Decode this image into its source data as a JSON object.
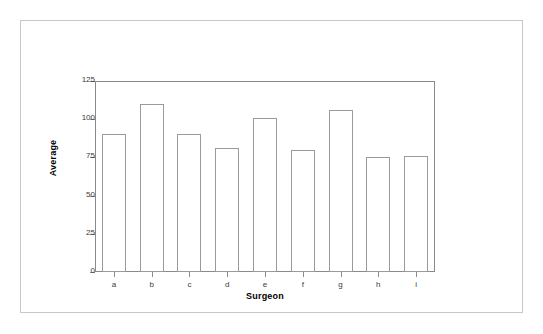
{
  "chart_data": {
    "type": "bar",
    "title": "",
    "subtitle": "",
    "xlabel": "Surgeon",
    "ylabel": "Average",
    "categories": [
      "a",
      "b",
      "c",
      "d",
      "e",
      "f",
      "g",
      "h",
      "i"
    ],
    "values": [
      90,
      110,
      90,
      81,
      101,
      80,
      106,
      75,
      76
    ],
    "ylim": [
      0,
      125
    ],
    "yticks": [
      0,
      25,
      50,
      75,
      100,
      125
    ],
    "ytick_labels": [
      "0",
      "25",
      "50",
      "75",
      "100",
      "125"
    ],
    "grid": false,
    "legend": null,
    "bar_fill_color": "#ffffff",
    "bar_edge_color": "#9a9a9a",
    "axis_color": "#8a8a8a",
    "frame_color": "#c8c8c8",
    "text_color": "#000000"
  }
}
